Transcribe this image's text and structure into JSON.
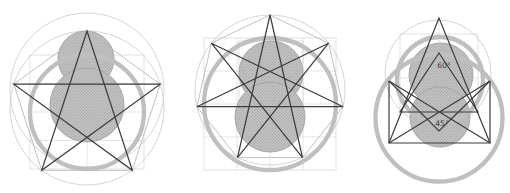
{
  "canvas": {
    "width": 510,
    "height": 193,
    "background": "#ffffff"
  },
  "colors": {
    "dark_line": "#3d3d3d",
    "mid_line": "#b9b9b9",
    "thin_circle": "#c9c9c9",
    "light_line": "#dadada",
    "thick_circle": "#bfbfbf",
    "fill_base": "#c2c2c2",
    "fill_dot": "#969696",
    "fill_edge": "#a6a6a6",
    "label_color": "#3a3a3a"
  },
  "figures": [
    {
      "name": "pentagram-construction",
      "star": {
        "points": 5,
        "step": 2,
        "cx": 87,
        "cy": 108,
        "r": 77,
        "start_deg": 90
      },
      "thin_circles": [
        {
          "cx": 87,
          "cy": 90,
          "r": 77
        },
        {
          "cx": 87,
          "cy": 108,
          "r": 77
        }
      ],
      "thick_circles": [
        {
          "cx": 87,
          "cy": 112,
          "r": 57
        }
      ],
      "filled_circles": [
        {
          "cx": 86,
          "cy": 59,
          "r": 28
        },
        {
          "cx": 87,
          "cy": 105,
          "r": 37
        }
      ],
      "light_rects": [
        {
          "x": 30,
          "y": 55,
          "w": 114,
          "h": 114
        }
      ],
      "light_lines": [
        {
          "x1": 87,
          "y1": 55,
          "x2": 87,
          "y2": 169
        },
        {
          "x1": 30,
          "y1": 112,
          "x2": 144,
          "y2": 112
        },
        {
          "x1": 30,
          "y1": 83.5,
          "x2": 144,
          "y2": 83.5
        },
        {
          "x1": 30,
          "y1": 140.5,
          "x2": 144,
          "y2": 140.5
        }
      ],
      "mid_polygons": [
        "87,31 160.2,84.2 132.3,170.3 41.7,170.3 13.8,84.2",
        "87,46 55,118 119,118"
      ],
      "dark_polygons": [],
      "dark_polylines": [],
      "labels": []
    },
    {
      "name": "heptagram-construction",
      "star": {
        "points": 7,
        "step": 3,
        "cx": 270,
        "cy": 90,
        "r": 75,
        "start_deg": 90
      },
      "thin_circles": [
        {
          "cx": 270,
          "cy": 90,
          "r": 75
        }
      ],
      "thick_circles": [
        {
          "cx": 270,
          "cy": 104,
          "r": 66
        }
      ],
      "filled_circles": [
        {
          "cx": 271,
          "cy": 73,
          "r": 32
        },
        {
          "cx": 270,
          "cy": 117,
          "r": 35
        }
      ],
      "light_rects": [
        {
          "x": 204,
          "y": 38,
          "w": 132,
          "h": 132
        },
        {
          "x": 239,
          "y": 41,
          "w": 64,
          "h": 64
        }
      ],
      "light_lines": [
        {
          "x1": 270,
          "y1": 38,
          "x2": 270,
          "y2": 170
        },
        {
          "x1": 204,
          "y1": 104,
          "x2": 336,
          "y2": 104
        },
        {
          "x1": 204,
          "y1": 71,
          "x2": 336,
          "y2": 71
        },
        {
          "x1": 204,
          "y1": 137,
          "x2": 336,
          "y2": 137
        },
        {
          "x1": 237,
          "y1": 38,
          "x2": 237,
          "y2": 170
        },
        {
          "x1": 303,
          "y1": 38,
          "x2": 303,
          "y2": 170
        }
      ],
      "mid_polygons": [
        "270,15 328.6,43.2 343.1,106.7 302.5,157.6 237.5,157.6 196.9,106.7 211.4,43.2"
      ],
      "dark_polygons": [],
      "dark_polylines": [],
      "labels": []
    },
    {
      "name": "angle-construction",
      "star": null,
      "thin_circles": [
        {
          "cx": 438,
          "cy": 73,
          "r": 53
        }
      ],
      "thick_circles": [
        {
          "cx": 440,
          "cy": 80,
          "r": 43
        },
        {
          "cx": 439,
          "cy": 118,
          "r": 63.5
        }
      ],
      "filled_circles": [
        {
          "cx": 441,
          "cy": 75,
          "r": 32
        },
        {
          "cx": 440,
          "cy": 117,
          "r": 30
        }
      ],
      "light_rects": [
        {
          "x": 400,
          "y": 34,
          "w": 78,
          "h": 78
        }
      ],
      "light_lines": [
        {
          "x1": 439,
          "y1": 18,
          "x2": 439,
          "y2": 143
        },
        {
          "x1": 400,
          "y1": 78,
          "x2": 478,
          "y2": 78
        }
      ],
      "mid_polygons": [],
      "dark_polygons": [
        "439,18 389,143 490,143",
        "439,53 400,112 478,112"
      ],
      "dark_polylines": [
        "389,81 439,131 490,81",
        "389,81 389,143",
        "490,81 490,143",
        "389,143 490,81",
        "490,143 389,81"
      ],
      "labels": [
        {
          "text": "60°",
          "x": 444,
          "y": 68
        },
        {
          "text": "45°",
          "x": 442,
          "y": 126
        }
      ]
    }
  ]
}
